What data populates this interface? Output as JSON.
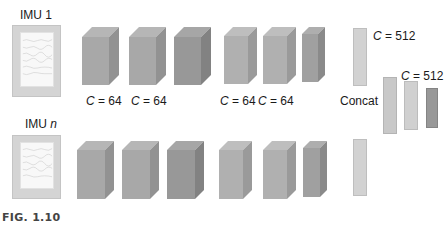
{
  "inputs": [
    {
      "label_main": "IMU ",
      "label_var": "1",
      "var_italic": false
    },
    {
      "label_main": "IMU ",
      "label_var": "n",
      "var_italic": true
    }
  ],
  "rows": [
    {
      "blocks": [
        {
          "x": 82,
          "y": 27,
          "w": 27,
          "h": 48,
          "d": 10,
          "color": "#a8a8a8"
        },
        {
          "x": 129,
          "y": 27,
          "w": 27,
          "h": 48,
          "d": 10,
          "color": "#a8a8a8"
        },
        {
          "x": 174,
          "y": 27,
          "w": 27,
          "h": 48,
          "d": 10,
          "color": "#989898"
        },
        {
          "x": 224,
          "y": 27,
          "w": 24,
          "h": 48,
          "d": 9,
          "color": "#b0b0b0"
        },
        {
          "x": 263,
          "y": 27,
          "w": 24,
          "h": 48,
          "d": 9,
          "color": "#b0b0b0"
        },
        {
          "x": 302,
          "y": 27,
          "w": 16,
          "h": 48,
          "d": 7,
          "color": "#a0a0a0"
        }
      ],
      "labels": [
        {
          "x": 86,
          "text_var": "C",
          "text_rest": " = 64"
        },
        {
          "x": 131,
          "text_var": "C",
          "text_rest": " = 64"
        },
        {
          "x": 220,
          "text_var": "C",
          "text_rest": " = 64"
        },
        {
          "x": 258,
          "text_var": "C",
          "text_rest": " = 64"
        }
      ]
    },
    {
      "blocks": [
        {
          "x": 77,
          "y": 141,
          "w": 28,
          "h": 49,
          "d": 9,
          "color": "#a8a8a8"
        },
        {
          "x": 122,
          "y": 141,
          "w": 28,
          "h": 49,
          "d": 9,
          "color": "#a8a8a8"
        },
        {
          "x": 167,
          "y": 141,
          "w": 28,
          "h": 49,
          "d": 9,
          "color": "#989898"
        },
        {
          "x": 219,
          "y": 141,
          "w": 24,
          "h": 49,
          "d": 9,
          "color": "#b0b0b0"
        },
        {
          "x": 263,
          "y": 141,
          "w": 24,
          "h": 49,
          "d": 9,
          "color": "#b0b0b0"
        },
        {
          "x": 303,
          "y": 141,
          "w": 17,
          "h": 49,
          "d": 7,
          "color": "#a0a0a0"
        }
      ],
      "labels": []
    }
  ],
  "concat": {
    "label": "Concat",
    "bars": [
      {
        "x": 353,
        "y": 28,
        "w": 14,
        "h": 58,
        "color": "#d2d2d2"
      },
      {
        "x": 353,
        "y": 139,
        "w": 14,
        "h": 57,
        "color": "#d2d2d2"
      }
    ],
    "top_label": {
      "var": "C",
      "rest": " = 512"
    }
  },
  "fc": {
    "bars": [
      {
        "x": 383,
        "y": 77,
        "w": 14,
        "h": 57,
        "color": "#c8c8c8"
      },
      {
        "x": 404,
        "y": 81,
        "w": 14,
        "h": 49,
        "color": "#d0d0d0"
      },
      {
        "x": 426,
        "y": 88,
        "w": 12,
        "h": 40,
        "color": "#989898"
      }
    ],
    "label": {
      "var": "C",
      "rest": " = 512"
    }
  },
  "caption": "FIG. 1.10"
}
